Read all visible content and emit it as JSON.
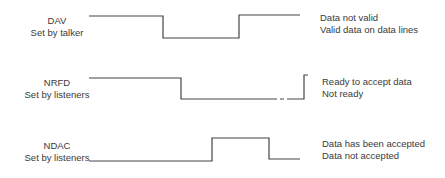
{
  "signals": [
    {
      "name": "DAV",
      "setter": "Set by talker",
      "states": {
        "high": "Data not valid",
        "low": "Valid data on data lines"
      }
    },
    {
      "name": "NRFD",
      "setter": "Set by listeners",
      "states": {
        "high": "Ready to accept data",
        "low": "Not ready"
      }
    },
    {
      "name": "NDAC",
      "setter": "Set by listeners",
      "states": {
        "high": "Data has been accepted",
        "low": "Data not accepted"
      }
    }
  ],
  "colors": {
    "line": "#444444",
    "text": "#3a3a3a",
    "background": "#ffffff"
  }
}
